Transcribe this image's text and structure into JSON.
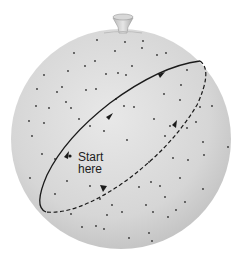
{
  "diagram": {
    "title": "",
    "label_line1": "Start",
    "label_line2": "here",
    "colors": {
      "background": "#ffffff",
      "sphere_light": "#e4e4e4",
      "sphere_dark": "#c2c2c2",
      "path": "#1a1a1a",
      "stars": "#333333"
    },
    "elements": [
      "celestial-sphere",
      "mount-knob",
      "solid-path-front",
      "dashed-path-back",
      "direction-arrows",
      "start-point",
      "stars"
    ]
  }
}
